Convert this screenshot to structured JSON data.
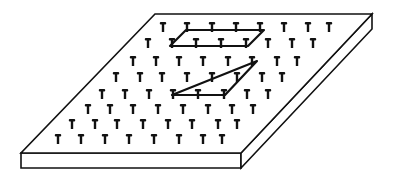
{
  "diagram": {
    "subject": "Geoboard with rubber-band shapes",
    "colors": {
      "background": "#ffffff",
      "ink": "#111111"
    },
    "board": {
      "top_face": {
        "back_left": [
          155,
          14
        ],
        "back_right": [
          372,
          14
        ],
        "front_right": [
          241,
          153
        ],
        "front_left": [
          21,
          153
        ]
      },
      "thickness": 15
    },
    "peg_grid": {
      "rows": 8,
      "cols": 8,
      "rows_y": [
        22,
        38,
        56,
        72,
        89,
        104,
        119,
        134
      ],
      "rows_x": [
        [
          163,
          187,
          212,
          236,
          260,
          284,
          308,
          329
        ],
        [
          148,
          172,
          196,
          221,
          246,
          268,
          292,
          313
        ],
        [
          133,
          156,
          179,
          203,
          228,
          252,
          277,
          297
        ],
        [
          116,
          140,
          162,
          187,
          212,
          237,
          262,
          282
        ],
        [
          102,
          125,
          149,
          173,
          198,
          224,
          247,
          268
        ],
        [
          88,
          110,
          133,
          158,
          183,
          208,
          232,
          253
        ],
        [
          72,
          95,
          117,
          143,
          168,
          192,
          218,
          237
        ],
        [
          58,
          81,
          105,
          129,
          154,
          179,
          203,
          222
        ]
      ]
    },
    "shapes": [
      {
        "name": "parallelogram",
        "points": [
          [
            186,
            30
          ],
          [
            264,
            30
          ],
          [
            248,
            46
          ],
          [
            170,
            46
          ]
        ]
      },
      {
        "name": "triangle",
        "points": [
          [
            172,
            95
          ],
          [
            225,
            95
          ],
          [
            257,
            61
          ]
        ]
      }
    ]
  }
}
